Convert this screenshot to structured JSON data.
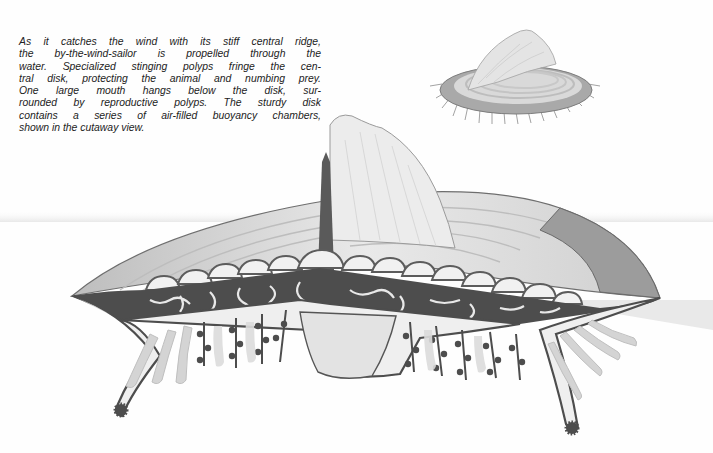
{
  "caption": {
    "lines": [
      "As it catches the wind with its stiff central ridge,",
      "the by-the-wind-sailor is propelled through the",
      "water. Specialized stinging polyps fringe the cen-",
      "tral disk, protecting the animal and numbing prey.",
      "One large mouth hangs below the disk, sur-",
      "rounded by reproductive polyps. The sturdy disk",
      "contains a series of air-filled buoyancy chambers,",
      "shown in the cutaway view."
    ]
  },
  "illustrations": {
    "inset": {
      "subject": "by-the-wind-sailor, whole animal",
      "icon": "velella-inset-icon"
    },
    "main": {
      "subject": "by-the-wind-sailor, cutaway view",
      "parts": [
        "central ridge (sail)",
        "float disk",
        "air-filled buoyancy chambers",
        "stinging polyps",
        "central mouth",
        "reproductive polyps"
      ]
    }
  },
  "footer": {
    "clipped_text": ""
  },
  "colors": {
    "background": "#fefefe",
    "text": "#222222",
    "ink_dark": "#4a4a4a",
    "ink_mid": "#8a8a8a",
    "ink_light": "#c8c8c8",
    "fill_pale": "#eeeeee"
  }
}
